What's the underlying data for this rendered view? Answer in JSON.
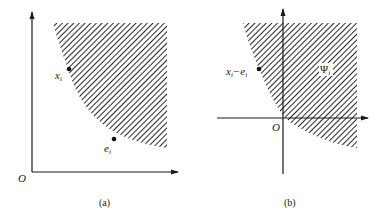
{
  "figure": {
    "panels": [
      {
        "id": "a",
        "caption": "(a)",
        "origin_label": "O",
        "points": [
          {
            "label": "x",
            "subscript": "i",
            "x": 69,
            "y": 69
          },
          {
            "label": "e",
            "subscript": "i",
            "x": 114,
            "y": 139
          }
        ]
      },
      {
        "id": "b",
        "caption": "(b)",
        "origin_label": "O",
        "points": [
          {
            "label": "x",
            "subscript": "i",
            "minus": "−e",
            "subscript2": "i",
            "x": 259,
            "y": 69
          }
        ],
        "region_label": "Ψ",
        "region_label_subscript": "i"
      }
    ],
    "colors": {
      "line": "#1a1a1a",
      "hatch": "#2a2a2a",
      "background": "#ffffff"
    }
  }
}
